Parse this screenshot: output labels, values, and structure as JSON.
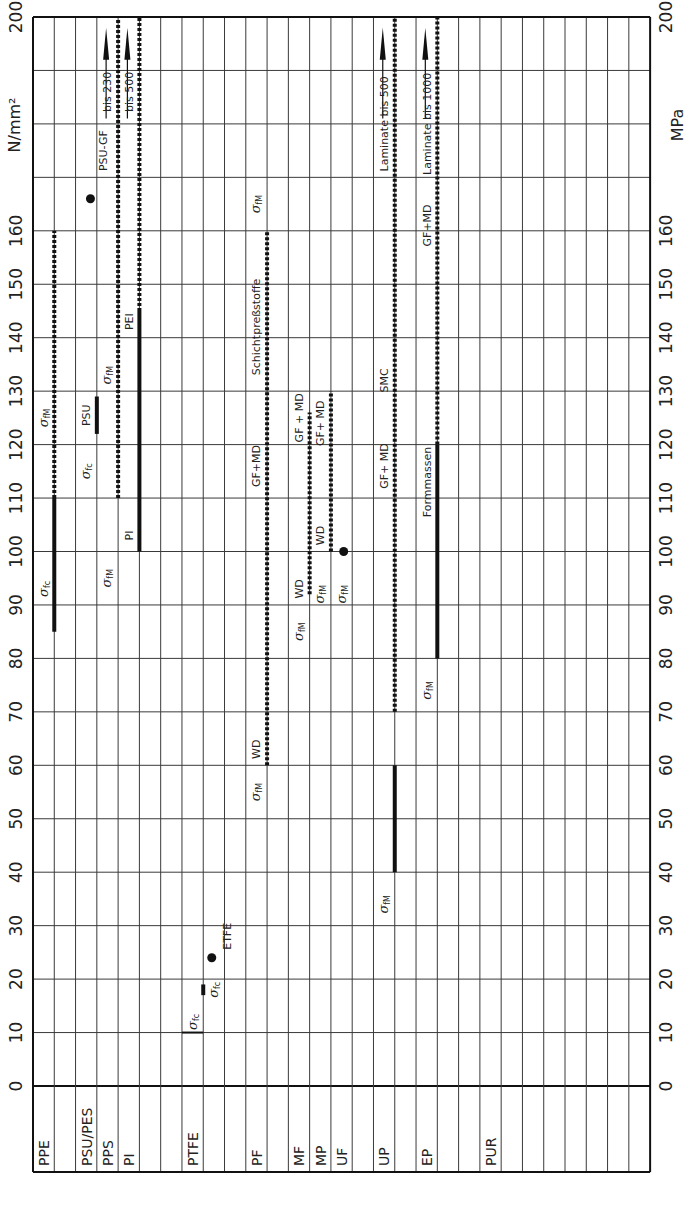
{
  "chart_data": {
    "type": "range-bar",
    "orientation": "rotated-90",
    "title": "",
    "ylabel_left": "N/mm²",
    "ylabel_right": "MPa",
    "ylim": [
      0,
      200
    ],
    "yticks": [
      0,
      10,
      20,
      30,
      40,
      50,
      60,
      70,
      80,
      90,
      100,
      110,
      120,
      130,
      140,
      150,
      160,
      200
    ],
    "grid_step": 10,
    "grid": true,
    "column_count": 29,
    "categories": [
      {
        "label": "PPE",
        "col": 0
      },
      {
        "label": "PSU/PES",
        "col": 2
      },
      {
        "label": "PPS",
        "col": 3
      },
      {
        "label": "PI",
        "col": 4
      },
      {
        "label": "PTFE",
        "col": 7
      },
      {
        "label": "PF",
        "col": 10
      },
      {
        "label": "MF",
        "col": 12
      },
      {
        "label": "MP",
        "col": 13
      },
      {
        "label": "UF",
        "col": 14
      },
      {
        "label": "UP",
        "col": 16
      },
      {
        "label": "EP",
        "col": 18
      },
      {
        "label": "PUR",
        "col": 21
      }
    ],
    "legend": {
      "solid": "σfc (compressive strength)",
      "dotted": "σfM (flexural strength)"
    },
    "series": [
      {
        "material": "PPE",
        "line": 1,
        "style": "solid",
        "from": 85,
        "to": 110,
        "label": "σfc"
      },
      {
        "material": "PPE",
        "line": 1,
        "style": "dotted",
        "from": 110,
        "to": 160,
        "label": "σfM"
      },
      {
        "material": "PSU",
        "line": 3,
        "style": "solid",
        "from": 122,
        "to": 129,
        "label": "PSU"
      },
      {
        "material": "PPS",
        "line": 4,
        "style": "dotted",
        "from": 110,
        "to": 200,
        "label": "σfM",
        "note": "bis 230",
        "arrow": true
      },
      {
        "material": "PI",
        "line": 5,
        "style": "solid",
        "from": 100,
        "to": 145,
        "label": "PI"
      },
      {
        "material": "PI",
        "line": 5,
        "style": "dotted",
        "from": 145,
        "to": 200,
        "label": "PEI",
        "note": "bis 500",
        "arrow": true
      },
      {
        "material": "PTFE",
        "line": 8,
        "style": "solid",
        "from": 17,
        "to": 19,
        "label": "σfc"
      },
      {
        "material": "PF",
        "line": 11,
        "style": "dotted",
        "from": 60,
        "to": 160,
        "label": "σfM",
        "notes": [
          "WD",
          "GF+MD",
          "Schichtpreßstoffe"
        ]
      },
      {
        "material": "MF",
        "line": 13,
        "style": "dotted",
        "from": 92,
        "to": 126,
        "label": "σfM",
        "notes": [
          "WD",
          "GF+MD"
        ]
      },
      {
        "material": "MP",
        "line": 14,
        "style": "dotted",
        "from": 100,
        "to": 130,
        "label": "σfM",
        "notes": [
          "WD",
          "GF+MD"
        ]
      },
      {
        "material": "UP",
        "line": 17,
        "style": "solid",
        "from": 40,
        "to": 60,
        "label": "σfM"
      },
      {
        "material": "UP",
        "line": 17,
        "style": "dotted",
        "from": 70,
        "to": 200,
        "label": "GF+MD",
        "notes": [
          "SMC",
          "Laminate bis 500"
        ],
        "arrow": true
      },
      {
        "material": "EP",
        "line": 19,
        "style": "solid",
        "from": 80,
        "to": 120,
        "label": "σfM",
        "notes": [
          "Formmassen"
        ]
      },
      {
        "material": "EP",
        "line": 19,
        "style": "dotted",
        "from": 120,
        "to": 200,
        "label": "GF+MD",
        "notes": [
          "Laminate bis 1000"
        ],
        "arrow": true
      }
    ],
    "points": [
      {
        "label": "PSU-GF",
        "x_line": 2.7,
        "value": 166
      },
      {
        "label": "ETFE",
        "x_line": 8.4,
        "value": 24
      },
      {
        "label": "UF",
        "x_line": 14.6,
        "value": 100
      }
    ],
    "ticks_horizontal": [
      {
        "x_from_line": 7,
        "x_to_line": 8,
        "value": 10,
        "label": "σfc"
      }
    ]
  },
  "axis_labels": {
    "left_unit": "N/mm²",
    "right_unit": "MPa"
  },
  "annotations": [
    {
      "text": "σfc",
      "line": 0.5,
      "value": 93
    },
    {
      "text": "σfM",
      "line": 0.5,
      "value": 125
    },
    {
      "text": "σfc",
      "line": 2.5,
      "value": 115
    },
    {
      "text": "PSU",
      "line": 2.5,
      "value": 125.5
    },
    {
      "text": "σfM",
      "line": 3.5,
      "value": 133
    },
    {
      "text": "PI",
      "line": 4.5,
      "value": 103
    },
    {
      "text": "σfM",
      "line": 3.5,
      "value": 95
    },
    {
      "text": "PEI",
      "line": 4.5,
      "value": 143
    },
    {
      "text": "bis 230",
      "line": 3.5,
      "value": 186
    },
    {
      "text": "bis 500",
      "line": 4.5,
      "value": 186
    },
    {
      "text": "PSU-GF",
      "line": 3.3,
      "value": 175
    },
    {
      "text": "σfc",
      "line": 7.5,
      "value": 12
    },
    {
      "text": "σfc",
      "line": 8.5,
      "value": 18
    },
    {
      "text": "ETFE",
      "line": 9.1,
      "value": 28
    },
    {
      "text": "σfM",
      "line": 10.5,
      "value": 55
    },
    {
      "text": "WD",
      "line": 10.5,
      "value": 63
    },
    {
      "text": "GF+MD",
      "line": 10.5,
      "value": 116
    },
    {
      "text": "Schichtpreßstoffe",
      "line": 10.5,
      "value": 142
    },
    {
      "text": "σfM",
      "line": 10.5,
      "value": 165
    },
    {
      "text": "σfM",
      "line": 12.5,
      "value": 85
    },
    {
      "text": "WD",
      "line": 12.5,
      "value": 93
    },
    {
      "text": "GF + MD",
      "line": 12.5,
      "value": 125
    },
    {
      "text": "σfM",
      "line": 13.5,
      "value": 92
    },
    {
      "text": "WD",
      "line": 13.5,
      "value": 103
    },
    {
      "text": "GF+ MD",
      "line": 13.5,
      "value": 124
    },
    {
      "text": "σfM",
      "line": 14.5,
      "value": 92
    },
    {
      "text": "σfM",
      "line": 16.5,
      "value": 34
    },
    {
      "text": "GF+ MD",
      "line": 16.5,
      "value": 116
    },
    {
      "text": "SMC",
      "line": 16.5,
      "value": 132
    },
    {
      "text": "Laminate  bis 500",
      "line": 16.5,
      "value": 180
    },
    {
      "text": "σfM",
      "line": 18.5,
      "value": 74
    },
    {
      "text": "Formmassen",
      "line": 18.5,
      "value": 113
    },
    {
      "text": "GF+MD",
      "line": 18.5,
      "value": 161
    },
    {
      "text": "Laminate  bis 1000",
      "line": 18.5,
      "value": 180
    }
  ]
}
